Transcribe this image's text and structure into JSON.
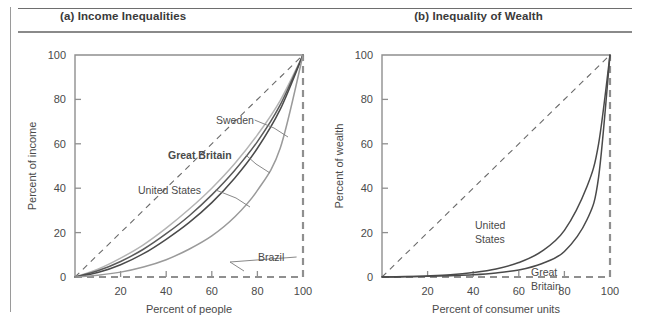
{
  "figure": {
    "panels": [
      {
        "id": "a",
        "title": "(a) Income Inequalities",
        "chart_ref": 0
      },
      {
        "id": "b",
        "title": "(b) Inequality of Wealth",
        "chart_ref": 1
      }
    ]
  },
  "chart_data": [
    {
      "type": "line",
      "title": "(a) Income Inequalities",
      "xlabel": "Percent of people",
      "ylabel": "Percent of income",
      "xlim": [
        0,
        100
      ],
      "ylim": [
        0,
        100
      ],
      "xticks": [
        0,
        20,
        40,
        60,
        80,
        100
      ],
      "yticks": [
        0,
        20,
        40,
        60,
        80,
        100
      ],
      "xtick_labels": [
        "0",
        "20",
        "40",
        "60",
        "80",
        "100"
      ],
      "ytick_labels": [
        "0",
        "20",
        "40",
        "60",
        "80",
        "100"
      ],
      "grid": false,
      "legend": "inline-annotations",
      "reference_line": {
        "name": "Line of perfect equality",
        "style": "dashed",
        "x": [
          0,
          100
        ],
        "y": [
          0,
          100
        ]
      },
      "series": [
        {
          "name": "Sweden",
          "color": "#b4b4b4",
          "x": [
            0,
            10,
            20,
            30,
            40,
            50,
            60,
            70,
            80,
            90,
            100
          ],
          "y": [
            0,
            3.5,
            8.5,
            14.5,
            22.0,
            30.5,
            40.0,
            51.0,
            64.0,
            79.5,
            100
          ]
        },
        {
          "name": "Great Britain",
          "color": "#5a5a5a",
          "x": [
            0,
            10,
            20,
            30,
            40,
            50,
            60,
            70,
            80,
            90,
            100
          ],
          "y": [
            0,
            2.8,
            7.0,
            12.5,
            19.5,
            27.5,
            37.0,
            48.0,
            61.0,
            77.5,
            100
          ]
        },
        {
          "name": "United States",
          "color": "#4a4a4a",
          "x": [
            0,
            10,
            20,
            30,
            40,
            50,
            60,
            70,
            80,
            90,
            100
          ],
          "y": [
            0,
            2.0,
            5.5,
            10.5,
            17.0,
            24.5,
            33.5,
            44.5,
            58.0,
            75.5,
            100
          ]
        },
        {
          "name": "Brazil",
          "color": "#9a9a9a",
          "x": [
            0,
            10,
            20,
            30,
            40,
            50,
            60,
            70,
            80,
            90,
            100
          ],
          "y": [
            0,
            0.8,
            2.2,
            4.5,
            7.8,
            12.5,
            18.5,
            27.0,
            39.0,
            58.0,
            100
          ]
        }
      ],
      "annotations": [
        {
          "label": "Sweden",
          "bold": false,
          "label_x": 198,
          "label_y": 91,
          "leader_to_x": 270,
          "leader_to_y": 104
        },
        {
          "label": "Great Britain",
          "bold": true,
          "label_x": 150,
          "label_y": 126,
          "leader_to_x": 252,
          "leader_to_y": 140
        },
        {
          "label": "United States",
          "bold": false,
          "label_x": 120,
          "label_y": 161,
          "leader_to_x": 232,
          "leader_to_y": 174
        },
        {
          "label": "Brazil",
          "bold": false,
          "label_x": 240,
          "label_y": 228,
          "leader_to_x": 226,
          "leader_to_y": 238
        }
      ]
    },
    {
      "type": "line",
      "title": "(b) Inequality of Wealth",
      "xlabel": "Percent of consumer units",
      "ylabel": "Percent of wealth",
      "xlim": [
        0,
        100
      ],
      "ylim": [
        0,
        100
      ],
      "xticks": [
        0,
        20,
        40,
        60,
        80,
        100
      ],
      "yticks": [
        0,
        20,
        40,
        60,
        80,
        100
      ],
      "xtick_labels": [
        "0",
        "20",
        "40",
        "60",
        "80",
        "100"
      ],
      "ytick_labels": [
        "0",
        "20",
        "40",
        "60",
        "80",
        "100"
      ],
      "grid": false,
      "legend": "inline-annotations",
      "reference_line": {
        "name": "Line of perfect equality",
        "style": "dashed",
        "x": [
          0,
          100
        ],
        "y": [
          0,
          100
        ]
      },
      "series": [
        {
          "name": "United States",
          "color": "#4a4a4a",
          "x": [
            0,
            10,
            20,
            30,
            40,
            50,
            60,
            70,
            80,
            90,
            95,
            100
          ],
          "y": [
            0,
            0.2,
            0.5,
            1.0,
            2.0,
            3.6,
            6.5,
            11.5,
            21.0,
            41.0,
            60.0,
            100
          ]
        },
        {
          "name": "Great Britain",
          "color": "#4a4a4a",
          "x": [
            0,
            10,
            20,
            30,
            40,
            50,
            60,
            70,
            80,
            90,
            95,
            100
          ],
          "y": [
            0,
            0.1,
            0.3,
            0.6,
            1.0,
            1.8,
            3.2,
            6.0,
            11.5,
            26.0,
            45.0,
            100
          ]
        }
      ],
      "annotations": [
        {
          "label": "United",
          "bold": false,
          "label_x": 150,
          "label_y": 196
        },
        {
          "label": "States",
          "bold": false,
          "label_x": 150,
          "label_y": 210
        },
        {
          "label": "Great",
          "bold": false,
          "label_x": 206,
          "label_y": 243
        },
        {
          "label": "Britain",
          "bold": false,
          "label_x": 206,
          "label_y": 257
        }
      ]
    }
  ]
}
